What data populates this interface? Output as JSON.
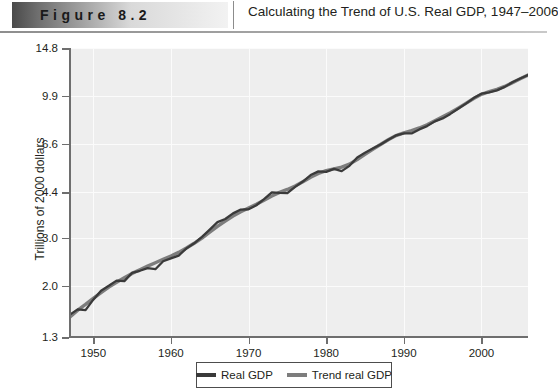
{
  "header": {
    "figure_label": "Figure 8.2",
    "title": "Calculating the Trend of U.S. Real GDP, 1947–2006"
  },
  "colors": {
    "real_gdp_line": "#3a3a3a",
    "trend_line": "#7d7d7d",
    "plot_background": "#eeeeee",
    "gridline": "#fbfbfb",
    "axis": "#6e6e6e",
    "text": "#231f20"
  },
  "legend": {
    "position": "bottom-center",
    "entries": [
      {
        "label": "Real GDP",
        "color": "#3a3a3a"
      },
      {
        "label": "Trend real GDP",
        "color": "#7d7d7d"
      }
    ]
  },
  "chart_data": {
    "type": "line",
    "title": "Calculating the Trend of U.S. Real GDP, 1947–2006",
    "xlabel": "",
    "ylabel": "Trillions of 2000 dollars",
    "yscale": "log",
    "ylim": [
      1.3,
      14.8
    ],
    "xlim": [
      1947,
      2006
    ],
    "grid": true,
    "ytick_labels": [
      "14.8",
      "9.9",
      "6.6",
      "4.4",
      "3.0",
      "2.0",
      "1.3"
    ],
    "ytick_values": [
      14.8,
      9.9,
      6.6,
      4.4,
      3.0,
      2.0,
      1.3
    ],
    "xtick_labels": [
      "1950",
      "1960",
      "1970",
      "1980",
      "1990",
      "2000"
    ],
    "xtick_values": [
      1950,
      1960,
      1970,
      1980,
      1990,
      2000
    ],
    "x": [
      1947,
      1948,
      1949,
      1950,
      1951,
      1952,
      1953,
      1954,
      1955,
      1956,
      1957,
      1958,
      1959,
      1960,
      1961,
      1962,
      1963,
      1964,
      1965,
      1966,
      1967,
      1968,
      1969,
      1970,
      1971,
      1972,
      1973,
      1974,
      1975,
      1976,
      1977,
      1978,
      1979,
      1980,
      1981,
      1982,
      1983,
      1984,
      1985,
      1986,
      1987,
      1988,
      1989,
      1990,
      1991,
      1992,
      1993,
      1994,
      1995,
      1996,
      1997,
      1998,
      1999,
      2000,
      2001,
      2002,
      2003,
      2004,
      2005,
      2006
    ],
    "series": [
      {
        "name": "Real GDP",
        "color": "#3a3a3a",
        "values": [
          1.57,
          1.64,
          1.63,
          1.78,
          1.92,
          2.0,
          2.09,
          2.08,
          2.23,
          2.27,
          2.32,
          2.3,
          2.46,
          2.52,
          2.58,
          2.74,
          2.86,
          3.02,
          3.21,
          3.42,
          3.51,
          3.68,
          3.8,
          3.81,
          3.94,
          4.15,
          4.39,
          4.37,
          4.36,
          4.6,
          4.81,
          5.08,
          5.24,
          5.22,
          5.35,
          5.25,
          5.49,
          5.89,
          6.13,
          6.35,
          6.57,
          6.84,
          7.09,
          7.22,
          7.21,
          7.46,
          7.67,
          7.98,
          8.18,
          8.5,
          8.88,
          9.27,
          9.71,
          10.08,
          10.18,
          10.36,
          10.67,
          11.09,
          11.45,
          11.8
        ]
      },
      {
        "name": "Trend real GDP",
        "color": "#7d7d7d",
        "values": [
          1.54,
          1.63,
          1.71,
          1.8,
          1.89,
          1.98,
          2.06,
          2.14,
          2.22,
          2.29,
          2.36,
          2.43,
          2.5,
          2.57,
          2.65,
          2.75,
          2.86,
          2.99,
          3.14,
          3.3,
          3.45,
          3.6,
          3.73,
          3.85,
          3.97,
          4.11,
          4.26,
          4.39,
          4.5,
          4.63,
          4.8,
          4.99,
          5.15,
          5.27,
          5.35,
          5.43,
          5.57,
          5.79,
          6.05,
          6.31,
          6.57,
          6.84,
          7.08,
          7.25,
          7.39,
          7.55,
          7.76,
          8.02,
          8.29,
          8.58,
          8.92,
          9.29,
          9.68,
          10.02,
          10.25,
          10.45,
          10.71,
          11.06,
          11.43,
          11.79
        ]
      }
    ]
  }
}
